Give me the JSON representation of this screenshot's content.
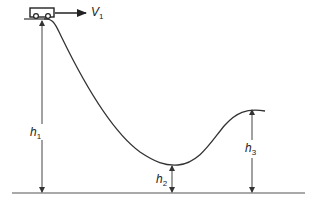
{
  "diagram": {
    "title": "",
    "velocity_label": {
      "symbol": "V",
      "subscript": "1"
    },
    "heights": [
      {
        "id": "h1",
        "symbol": "h",
        "subscript": "1"
      },
      {
        "id": "h2",
        "symbol": "h",
        "subscript": "2"
      },
      {
        "id": "h3",
        "symbol": "h",
        "subscript": "3"
      }
    ],
    "elements": [
      "cart",
      "track-curve",
      "ground-line",
      "velocity-arrow",
      "height-arrows"
    ],
    "colors": {
      "line": "#333333",
      "background": "#ffffff"
    }
  }
}
